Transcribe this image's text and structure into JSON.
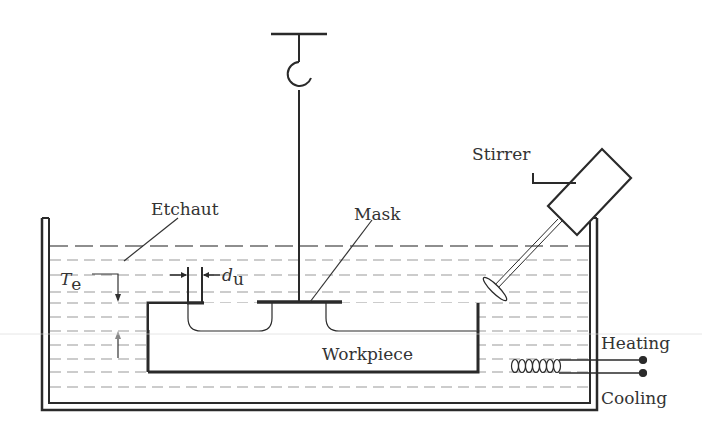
{
  "diagram": {
    "labels": {
      "etchant": "Etchaut",
      "mask": "Mask",
      "stirrer": "Stirrer",
      "workpiece": "Workpiece",
      "heating": "Heating",
      "cooling": "Cooling",
      "te_main": "T",
      "te_sub": "e",
      "du_main": "d",
      "du_sub": "u"
    },
    "colors": {
      "line": "#2a2a2a",
      "dash": "#8a8a8a",
      "text": "#333333",
      "background": "#ffffff"
    }
  }
}
